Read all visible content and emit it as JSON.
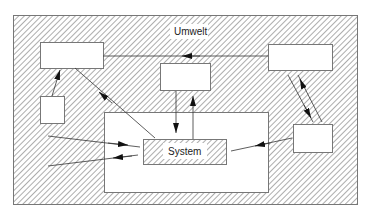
{
  "diagram": {
    "environment_label": "Umwelt",
    "system_label": "System",
    "colors": {
      "hatch": "#8a8a8a",
      "line": "#333333",
      "box_fill": "#ffffff",
      "border": "#777777"
    },
    "nodes": [
      {
        "id": "environment",
        "label": "Umwelt",
        "kind": "hatched-frame"
      },
      {
        "id": "box-top-left",
        "label": ""
      },
      {
        "id": "box-top-right",
        "label": ""
      },
      {
        "id": "box-top-center",
        "label": ""
      },
      {
        "id": "box-small-left",
        "label": ""
      },
      {
        "id": "box-bottom-right",
        "label": ""
      },
      {
        "id": "system-boundary",
        "label": "",
        "kind": "white-region"
      },
      {
        "id": "system",
        "label": "System",
        "kind": "hatched-box"
      }
    ],
    "edges": [
      {
        "from": "box-top-right",
        "to": "box-top-left"
      },
      {
        "from": "box-small-left",
        "to": "box-top-left"
      },
      {
        "from": "system",
        "to": "box-top-left"
      },
      {
        "from": "box-top-center",
        "to": "system"
      },
      {
        "from": "system",
        "to": "box-top-center"
      },
      {
        "from": "box-bottom-right",
        "to": "box-top-right"
      },
      {
        "from": "box-top-right",
        "to": "box-bottom-right"
      },
      {
        "from": "box-bottom-right",
        "to": "system"
      },
      {
        "from": "environment-left-upper",
        "to": "system"
      },
      {
        "from": "system",
        "to": "environment-left-lower"
      }
    ]
  }
}
